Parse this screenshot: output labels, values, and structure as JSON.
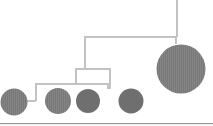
{
  "figure": {
    "canvas": {
      "width": 213,
      "height": 126
    },
    "background_color": "#ffffff",
    "arm_color": "#b9b9b9",
    "arm_highlight_color": "#dcdcdc",
    "disc_color": "#777777",
    "disc_hatch_color": "#8d8d8d",
    "baseline_color": "#9a9a9a",
    "arm_thickness": 2,
    "labels": {
      "suspension": "suspension-line",
      "baseline": "ground-line"
    }
  },
  "structure": {
    "suspension_line": {
      "name": "top-suspension-cord",
      "x": 177,
      "y1": 0,
      "y2": 37
    },
    "arms": [
      {
        "id": "arm-1-top",
        "label": "Top arm",
        "y": 37,
        "x1": 84,
        "x2": 177,
        "left_drop_to": 69,
        "right_drop_to": 44
      },
      {
        "id": "arm-2-upper-mid",
        "label": "Second arm",
        "y": 69,
        "x1": 75,
        "x2": 111,
        "left_drop_to": 84,
        "right_drop_to": 89
      },
      {
        "id": "arm-3-lower-mid",
        "label": "Third arm",
        "y": 84,
        "x1": 35,
        "x2": 109,
        "left_drop_to": 101,
        "right_drop_to": 89
      },
      {
        "id": "arm-4-bottom",
        "label": "Bottom arm",
        "y": 101,
        "x1": 14,
        "x2": 36,
        "left_drop_to": 101,
        "right_drop_to": 101
      }
    ],
    "risers": [
      {
        "id": "riser-top-to-arm2",
        "x": 85,
        "y1": 37,
        "y2": 69
      },
      {
        "id": "riser-arm2-to-arm3",
        "x": 75,
        "y1": 69,
        "y2": 84
      }
    ]
  },
  "discs": [
    {
      "id": "disc-1",
      "label": "Disc 1",
      "cx": 14,
      "cy": 102,
      "r": 13.5,
      "size": "medium"
    },
    {
      "id": "disc-2",
      "label": "Disc 2",
      "cx": 58,
      "cy": 101,
      "r": 13.0,
      "size": "medium"
    },
    {
      "id": "disc-3",
      "label": "Disc 3",
      "cx": 88,
      "cy": 101,
      "r": 12.0,
      "size": "medium"
    },
    {
      "id": "disc-4",
      "label": "Disc 4",
      "cx": 131,
      "cy": 101,
      "r": 12.5,
      "size": "medium"
    },
    {
      "id": "disc-5",
      "label": "Disc 5",
      "cx": 181,
      "cy": 69,
      "r": 24.5,
      "size": "large"
    }
  ],
  "baseline": {
    "y": 124,
    "x1": 0,
    "x2": 213
  }
}
